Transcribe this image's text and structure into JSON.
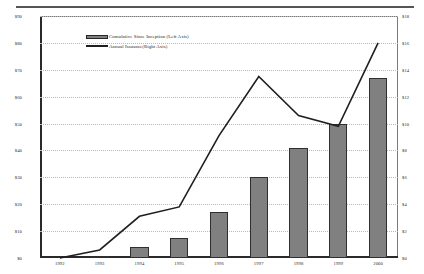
{
  "chart_data": {
    "type": "bar",
    "title": "",
    "xlabel": "",
    "categories": [
      "1992",
      "1993",
      "1994",
      "1995",
      "1996",
      "1997",
      "1998",
      "1999",
      "2000"
    ],
    "grid": true,
    "legend_position": "top-left",
    "left_axis": {
      "label": "Cumulative Since Inception (Left Axis)",
      "ylim": [
        0,
        90
      ],
      "ticks": [
        0,
        10,
        20,
        30,
        40,
        50,
        60,
        70,
        80,
        90
      ],
      "tick_labels": [
        "$0",
        "$10",
        "$20",
        "$30",
        "$40",
        "$50",
        "$60",
        "$70",
        "$80",
        "$90"
      ]
    },
    "right_axis": {
      "label": "Annual Issuance(Right Axis)",
      "ylim": [
        0,
        18
      ],
      "ticks": [
        0,
        2,
        4,
        6,
        8,
        10,
        12,
        14,
        16,
        18
      ],
      "tick_labels": [
        "$0",
        "$2",
        "$4",
        "$6",
        "$8",
        "$10",
        "$12",
        "$14",
        "$16",
        "$18"
      ]
    },
    "series": [
      {
        "name": "Cumulative Since Inception (Left Axis)",
        "type": "bar",
        "axis": "left",
        "color": "#808080",
        "edge_color": "#2f2f2f",
        "values": [
          0,
          0.5,
          4,
          7.5,
          17,
          30,
          41,
          50,
          67
        ]
      },
      {
        "name": "Annual Issuance(Right Axis)",
        "type": "line",
        "axis": "right",
        "color": "#1f1f1f",
        "values": [
          0,
          0.6,
          3.1,
          3.8,
          9.1,
          13.5,
          10.6,
          9.8,
          16.0
        ]
      }
    ]
  },
  "legend": {
    "items": [
      {
        "label": "Cumulative Since Inception (Left Axis)",
        "marker": "bar-swatch"
      },
      {
        "label": "Annual Issuance(Right Axis)",
        "marker": "line-swatch"
      }
    ]
  }
}
